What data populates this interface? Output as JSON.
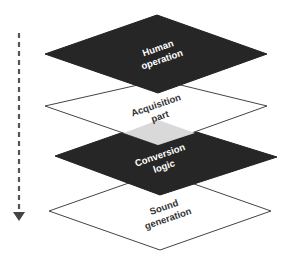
{
  "diagram": {
    "type": "stacked-layers",
    "direction_arrow": {
      "style": "dashed",
      "direction": "down",
      "color": "#555555"
    },
    "layers": [
      {
        "id": "human-operation",
        "line1": "Human",
        "line2": "operation",
        "fill": "#262626",
        "text_color": "#ffffff"
      },
      {
        "id": "acquisition-part",
        "line1": "Acquisition",
        "line2": "part",
        "fill": "#ffffff",
        "text_color": "#333333"
      },
      {
        "id": "conversion-logic",
        "line1": "Conversion",
        "line2": "logic",
        "fill": "#262626",
        "text_color": "#ffffff"
      },
      {
        "id": "sound-generation",
        "line1": "Sound",
        "line2": "generation",
        "fill": "#ffffff",
        "text_color": "#333333"
      }
    ],
    "overlap_fill": "#d9d9d9"
  }
}
